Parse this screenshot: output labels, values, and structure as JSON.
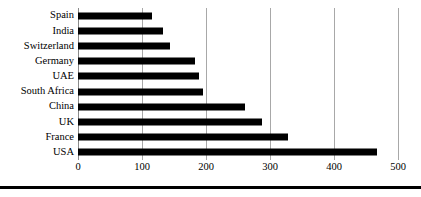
{
  "chart_data": {
    "type": "bar",
    "orientation": "horizontal",
    "title": "",
    "subtitle": "",
    "xlabel": "",
    "ylabel": "",
    "categories": [
      "Spain",
      "India",
      "Switzerland",
      "Germany",
      "UAE",
      "South Africa",
      "China",
      "UK",
      "France",
      "USA"
    ],
    "values": [
      116,
      133,
      144,
      183,
      189,
      195,
      261,
      287,
      328,
      467
    ],
    "xlim": [
      0,
      500
    ],
    "x_ticks": [
      0,
      100,
      200,
      300,
      400,
      500
    ],
    "x_tick_labels": [
      "0",
      "100",
      "200",
      "300",
      "400",
      "500"
    ],
    "grid": "vertical",
    "legend": null,
    "legend_position": "none",
    "bar_color": "#000000",
    "gridline_color": "#a8a8a8",
    "background_color": "#ffffff",
    "annotations": []
  },
  "figure": {
    "bottom_rule_color": "#000000"
  }
}
